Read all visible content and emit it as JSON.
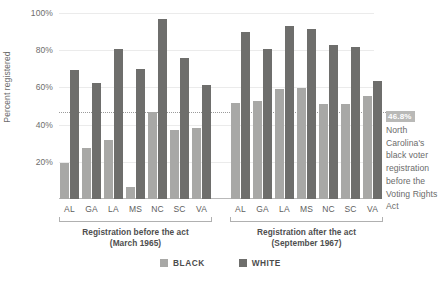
{
  "chart_data": {
    "type": "bar",
    "title": "",
    "subtitle": "",
    "xlabel": "",
    "ylabel": "Percent registered",
    "ylim": [
      0,
      100
    ],
    "yticks": [
      20,
      40,
      60,
      80,
      100
    ],
    "ytick_labels": [
      "20%",
      "40%",
      "60%",
      "80%",
      "100%"
    ],
    "grid": true,
    "legend_position": "bottom",
    "categories": [
      "AL",
      "GA",
      "LA",
      "MS",
      "NC",
      "SC",
      "VA"
    ],
    "groups": [
      {
        "label_line1": "Registration before the act",
        "label_line2": "(March 1965)",
        "series": [
          {
            "name": "BLACK",
            "color": "#a8a8a6",
            "values": [
              19.3,
              27.4,
              31.6,
              6.7,
              46.8,
              37.3,
              38.3
            ]
          },
          {
            "name": "WHITE",
            "color": "#6e6e6c",
            "values": [
              69.2,
              62.6,
              80.5,
              69.9,
              96.8,
              75.7,
              61.1
            ]
          }
        ]
      },
      {
        "label_line2": "(September 1967)",
        "label_line1": "Registration after the act",
        "series": [
          {
            "name": "BLACK",
            "color": "#a8a8a6",
            "values": [
              51.6,
              52.6,
              58.9,
              59.8,
              51.3,
              51.0,
              55.6
            ]
          },
          {
            "name": "WHITE",
            "color": "#6e6e6c",
            "values": [
              89.6,
              80.4,
              93.1,
              91.5,
              83.0,
              81.7,
              63.4
            ]
          }
        ]
      }
    ],
    "reference_line": {
      "value": 46.8,
      "value_label": "46.8%",
      "style": "dotted",
      "annotation": "North Carolina's black voter registration before the Voting Rights Act"
    },
    "legend": [
      {
        "label": "BLACK",
        "color": "#a8a8a6"
      },
      {
        "label": "WHITE",
        "color": "#6e6e6c"
      }
    ]
  },
  "colors": {
    "black_series": "#a8a8a6",
    "white_series": "#6e6e6c",
    "gridline": "#ebebeb",
    "reference": "#9b9b9b",
    "badge_bg": "#b9b9b7",
    "text": "#6b6b6b"
  }
}
